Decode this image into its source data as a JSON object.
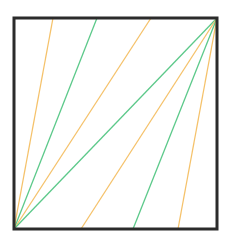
{
  "diagram": {
    "square": {
      "x1": 14,
      "y1": 18,
      "x2": 217,
      "y2": 229,
      "stroke": "#2b2b2b",
      "stroke_width": 3
    },
    "colors": {
      "green": "#5cc98a",
      "orange": "#f5c26b"
    },
    "lines_from_bottom_left": [
      {
        "x1": 14,
        "y1": 229,
        "x2": 53,
        "y2": 18,
        "color": "orange"
      },
      {
        "x1": 14,
        "y1": 229,
        "x2": 97,
        "y2": 18,
        "color": "green"
      },
      {
        "x1": 14,
        "y1": 229,
        "x2": 151,
        "y2": 18,
        "color": "orange"
      },
      {
        "x1": 14,
        "y1": 229,
        "x2": 217,
        "y2": 18,
        "color": "green"
      }
    ],
    "lines_from_top_right": [
      {
        "x1": 217,
        "y1": 18,
        "x2": 81,
        "y2": 229,
        "color": "orange"
      },
      {
        "x1": 217,
        "y1": 18,
        "x2": 133,
        "y2": 229,
        "color": "green"
      },
      {
        "x1": 217,
        "y1": 18,
        "x2": 178,
        "y2": 229,
        "color": "orange"
      }
    ]
  }
}
